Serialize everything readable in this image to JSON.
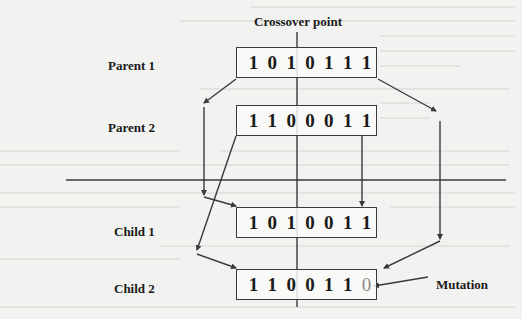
{
  "title": "Crossover point",
  "parents": [
    {
      "label": "Parent 1",
      "bits": [
        "1",
        "0",
        "1",
        "0",
        "1",
        "1",
        "1"
      ]
    },
    {
      "label": "Parent 2",
      "bits": [
        "1",
        "1",
        "0",
        "0",
        "0",
        "1",
        "1"
      ]
    }
  ],
  "children": [
    {
      "label": "Child 1",
      "bits": [
        "1",
        "0",
        "1",
        "0",
        "0",
        "1",
        "1"
      ]
    },
    {
      "label": "Child 2",
      "bits": [
        "1",
        "1",
        "0",
        "0",
        "1",
        "1",
        "0"
      ]
    }
  ],
  "annotations": {
    "mutation": "Mutation"
  },
  "colors": {
    "line": "#3a3a3a",
    "text": "#1a1a1a",
    "mutated_bit": "#8a8a8a",
    "background": "#f2f2f0"
  }
}
